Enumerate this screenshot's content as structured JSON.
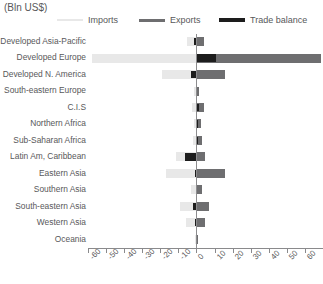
{
  "axis_unit_label": "(Bln US$)",
  "legend": {
    "items": [
      {
        "label": "Imports",
        "color": "#e8e8e8",
        "thickness": 2
      },
      {
        "label": "Exports",
        "color": "#6e6e70",
        "thickness": 3
      },
      {
        "label": "Trade balance",
        "color": "#1d1d1d",
        "thickness": 4
      }
    ]
  },
  "chart_data": {
    "type": "bar",
    "orientation": "horizontal",
    "title": "",
    "subtitle": "",
    "xlabel": "(Bln US$)",
    "ylabel": "",
    "xlim": [
      -60,
      70
    ],
    "xticks": [
      -60,
      -50,
      -40,
      -30,
      -20,
      -10,
      0,
      10,
      20,
      30,
      40,
      50,
      60,
      70
    ],
    "xticklabels": [
      "-60",
      "-50",
      "-40",
      "-30",
      "-20",
      "-10",
      "0",
      "10",
      "20",
      "30",
      "40",
      "50",
      "60",
      "70"
    ],
    "grid": false,
    "legend_position": "top",
    "zero_line": 0,
    "categories": [
      "Developed Asia-Pacific",
      "Developed Europe",
      "Developed N. America",
      "South-eastern Europe",
      "C.I.S",
      "Northern Africa",
      "Sub-Saharan Africa",
      "Latin Am, Caribbean",
      "Eastern Asia",
      "Southern Asia",
      "South-eastern Asia",
      "Western Asia",
      "Oceania"
    ],
    "series": [
      {
        "name": "Imports",
        "color": "#e8e8e8",
        "note": "plotted as negative values extending left from zero",
        "values": [
          -5.0,
          -58.0,
          -19.0,
          -1.2,
          -2.5,
          -1.5,
          -2.0,
          -11.5,
          -17.0,
          -3.0,
          -9.0,
          -6.0,
          -1.0
        ]
      },
      {
        "name": "Exports",
        "color": "#6e6e70",
        "note": "plotted as positive values extending right from zero",
        "values": [
          4.0,
          69.0,
          16.0,
          1.5,
          4.0,
          2.5,
          3.0,
          5.0,
          16.0,
          3.0,
          7.0,
          5.0,
          1.0
        ]
      },
      {
        "name": "Trade balance",
        "color": "#1d1d1d",
        "values": [
          -1.5,
          11.0,
          -3.0,
          0.4,
          1.5,
          1.0,
          1.0,
          -6.5,
          -1.0,
          0.0,
          -2.0,
          -1.0,
          0.0
        ]
      }
    ]
  }
}
